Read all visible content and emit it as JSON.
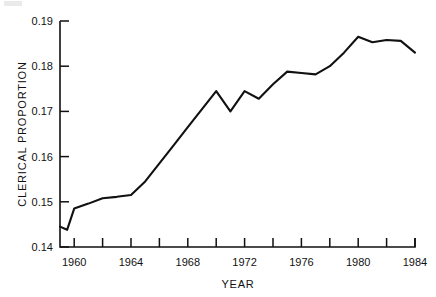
{
  "chart_data": {
    "type": "line",
    "title": "",
    "xlabel": "YEAR",
    "ylabel": "CLERICAL PROPORTION",
    "xlim": [
      1959,
      1984
    ],
    "ylim": [
      0.14,
      0.19
    ],
    "grid": false,
    "legend": null,
    "x_tick_labels": [
      "1960",
      "1964",
      "1968",
      "1972",
      "1976",
      "1980",
      "1984"
    ],
    "x_labeled_ticks": [
      1960,
      1964,
      1968,
      1972,
      1976,
      1980,
      1984
    ],
    "x_minor_ticks": [
      1962,
      1966,
      1970,
      1974,
      1978,
      1982
    ],
    "y_tick_labels": [
      "0.14",
      "0.15",
      "0.16",
      "0.17",
      "0.18",
      "0.19"
    ],
    "y_ticks": [
      0.14,
      0.15,
      0.16,
      0.17,
      0.18,
      0.19
    ],
    "x": [
      1959,
      1959.5,
      1960,
      1961,
      1962,
      1963,
      1964,
      1965,
      1966,
      1967,
      1968,
      1969,
      1970,
      1971,
      1972,
      1973,
      1974,
      1975,
      1976,
      1977,
      1978,
      1979,
      1980,
      1981,
      1982,
      1983,
      1984
    ],
    "values": [
      0.1445,
      0.1438,
      0.1485,
      0.1496,
      0.1508,
      0.1511,
      0.1515,
      0.1545,
      0.1585,
      0.1625,
      0.1665,
      0.1705,
      0.1745,
      0.17,
      0.1745,
      0.1728,
      0.176,
      0.1788,
      0.1785,
      0.1782,
      0.18,
      0.183,
      0.1865,
      0.1853,
      0.1858,
      0.1856,
      0.183
    ],
    "series": [
      {
        "name": "Clerical proportion",
        "color": "#111111",
        "values": [
          0.1445,
          0.1438,
          0.1485,
          0.1496,
          0.1508,
          0.1511,
          0.1515,
          0.1545,
          0.1585,
          0.1625,
          0.1665,
          0.1705,
          0.1745,
          0.17,
          0.1745,
          0.1728,
          0.176,
          0.1788,
          0.1785,
          0.1782,
          0.18,
          0.183,
          0.1865,
          0.1853,
          0.1858,
          0.1856,
          0.183
        ]
      }
    ]
  }
}
